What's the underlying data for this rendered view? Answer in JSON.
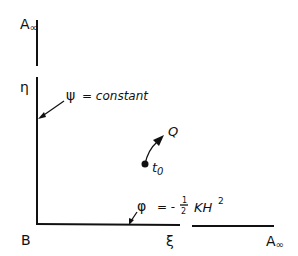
{
  "diagram": {
    "labels": {
      "top_left": "A",
      "top_left_sub": "∞",
      "eta": "η",
      "origin": "B",
      "xi": "ξ",
      "bottom_right": "A",
      "bottom_right_sub": "∞",
      "psi_eq_left": "ψ",
      "psi_eq_right": "= constant",
      "phi_eq_left": "φ",
      "phi_eq_mid": "= -",
      "phi_frac_num": "1",
      "phi_frac_den": "2",
      "phi_eq_right": "KH",
      "phi_sup": "2",
      "point_label": "t",
      "point_sub": "0",
      "arrow_label": "Q"
    },
    "colors": {
      "ink": "#111111",
      "background": "#ffffff"
    }
  }
}
